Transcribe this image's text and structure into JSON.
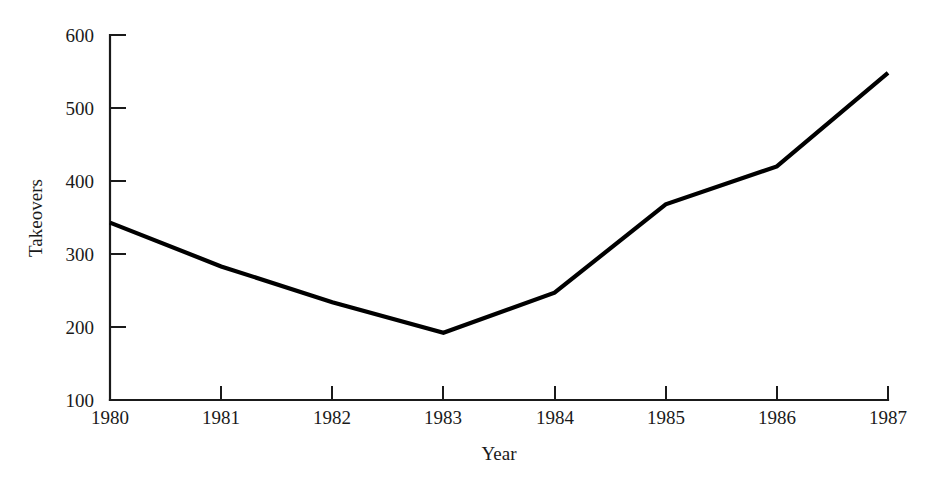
{
  "chart_data": {
    "type": "line",
    "title": "",
    "xlabel": "Year",
    "ylabel": "Takeovers",
    "categories": [
      "1980",
      "1981",
      "1982",
      "1983",
      "1984",
      "1985",
      "1986",
      "1987"
    ],
    "x": [
      1980,
      1981,
      1982,
      1983,
      1984,
      1985,
      1986,
      1987
    ],
    "values": [
      343,
      283,
      234,
      192,
      247,
      368,
      420,
      548
    ],
    "series": [
      {
        "name": "Takeovers",
        "values": [
          343,
          283,
          234,
          192,
          247,
          368,
          420,
          548
        ],
        "color": "#000000"
      }
    ],
    "xlim": [
      1980,
      1987
    ],
    "ylim": [
      100,
      600
    ],
    "yticks": [
      100,
      200,
      300,
      400,
      500,
      600
    ],
    "ytick_labels": [
      "100",
      "200",
      "300",
      "400",
      "500",
      "600"
    ],
    "xticks": [
      1980,
      1981,
      1982,
      1983,
      1984,
      1985,
      1986,
      1987
    ],
    "xtick_labels": [
      "1980",
      "1981",
      "1982",
      "1983",
      "1984",
      "1985",
      "1986",
      "1987"
    ],
    "grid": false,
    "legend": false,
    "legend_position": "none",
    "line_color": "#000000",
    "axis_color": "#1a1a1a",
    "background_color": "#ffffff",
    "markers": false,
    "tick_direction": "out"
  }
}
